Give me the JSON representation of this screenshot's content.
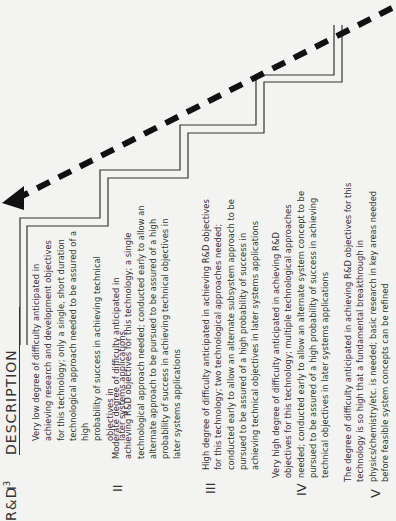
{
  "header": {
    "rd_label": "R&D",
    "rd_sup": "3",
    "description_label": "DESCRIPTION"
  },
  "levels": [
    {
      "numeral": "I",
      "lines": [
        "Very low degree of difficulty anticipated in",
        "achieving research and development objectives",
        "for this technology; only a single, short duration",
        "technological approach needed to be assured of a high",
        "probability of success in achieving technical objectives in",
        "later systems applications"
      ]
    },
    {
      "numeral": "II",
      "lines": [
        "Moderate degree of difficulty anticipated in",
        "achieving R&D objectives for this technology; a single",
        "technological approach needed; conducted early to allow an",
        "alternate approach to be pursued to be assured of a high",
        "probability of success in achieving technical objectives in",
        "later systems applications"
      ]
    },
    {
      "numeral": "III",
      "lines": [
        "High degree of difficulty anticipated in achieving R&D objectives",
        "for this technology; two technological approaches needed;",
        "conducted early to allow an alternate subsystem approach to be",
        "pursued to be assured of a high probability of success in",
        "achieving technical objectives in later systems applications"
      ]
    },
    {
      "numeral": "IV",
      "lines": [
        "Very high degree of difficulty anticipated in achieving R&D",
        "objectives for this technology; multiple technological approaches",
        "needed; conducted early to allow an alternate system concept to be",
        "pursued to be assured of a high probability of success in achieving",
        "technical objectives in later systems applications"
      ]
    },
    {
      "numeral": "V",
      "lines": [
        "The degree of difficulty anticipated in achieving R&D objectives for this",
        "technology is so high that a fundamental breakthrough in",
        "physics/chemistry/etc. is needed; basic research in key areas needed",
        "before feasible system concepts can be refined"
      ]
    }
  ],
  "graphic": {
    "arrow": "dashed-arrow-increasing-difficulty",
    "stair_color": "#333333",
    "arrow_color": "#111111"
  }
}
